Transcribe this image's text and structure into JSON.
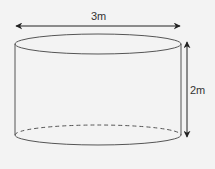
{
  "diagram": {
    "shape": "cylinder",
    "width_label": "3m",
    "height_label": "2m",
    "colors": {
      "background": "#f3f3f3",
      "stroke": "#555555",
      "arrow": "#222222",
      "text": "#333333"
    }
  }
}
